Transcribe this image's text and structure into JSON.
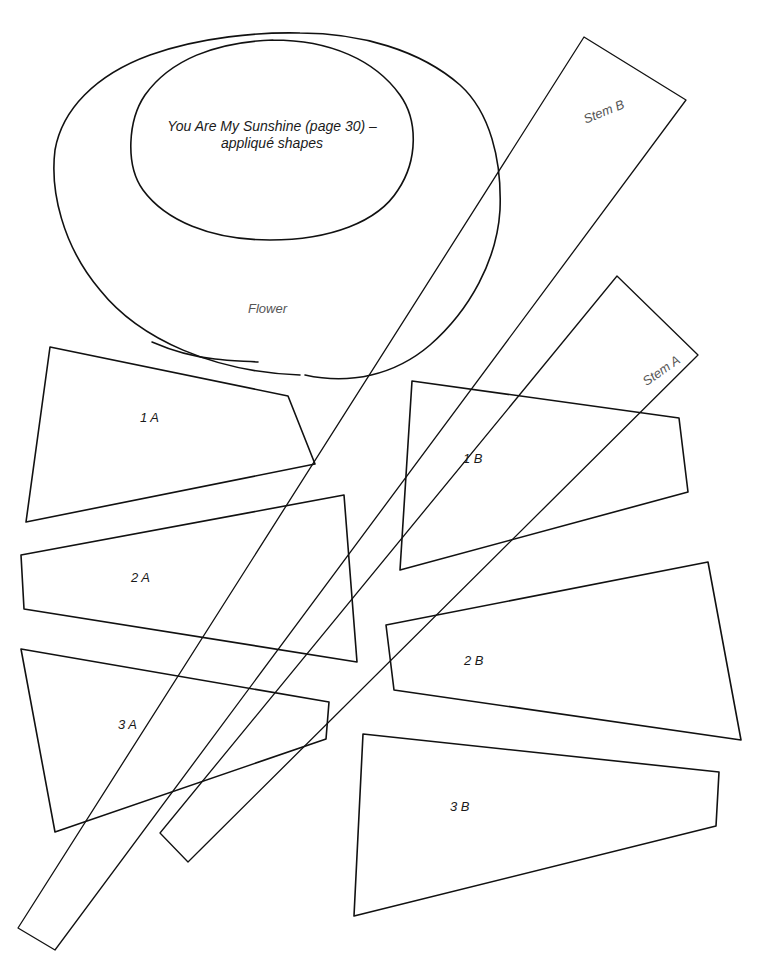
{
  "title": {
    "line1": "You Are My Sunshine (page 30) –",
    "line2": "appliqué shapes"
  },
  "shapes": {
    "flower": {
      "label": "Flower"
    },
    "stem_b": {
      "label": "Stem B"
    },
    "stem_a": {
      "label": "Stem A"
    },
    "piece_1a": {
      "label": "1 A"
    },
    "piece_1b": {
      "label": "1 B"
    },
    "piece_2a": {
      "label": "2 A"
    },
    "piece_2b": {
      "label": "2 B"
    },
    "piece_3a": {
      "label": "3 A"
    },
    "piece_3b": {
      "label": "3 B"
    }
  },
  "colors": {
    "stroke": "#111111",
    "background": "#ffffff",
    "label_text": "#1a1a1a",
    "light_label_text": "#555555"
  }
}
